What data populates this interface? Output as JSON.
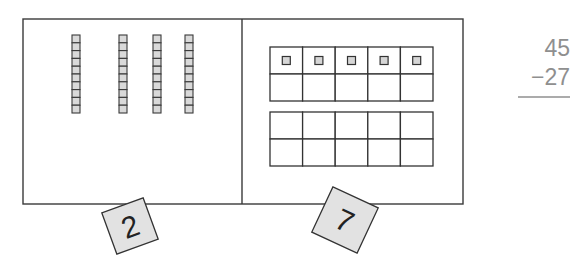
{
  "diagram": {
    "type": "place-value-subtraction",
    "tens_panel": {
      "rods": 4,
      "cubes_per_rod": 10,
      "rod_x": [
        72,
        119,
        153,
        185
      ],
      "card": {
        "label": "2",
        "meaning": "tens digit"
      }
    },
    "ones_panel": {
      "ten_frames": 2,
      "cells_per_frame": 10,
      "filled_units": 5,
      "card": {
        "label": "7",
        "meaning": "ones digit"
      }
    },
    "problem": {
      "minuend": "45",
      "subtrahend": "−27",
      "operator": "subtraction"
    }
  },
  "colors": {
    "stroke": "#333333",
    "cube_fill": "#d9d9d9",
    "card_fill": "#e2e2e2",
    "problem_text": "#8f8f8f"
  }
}
